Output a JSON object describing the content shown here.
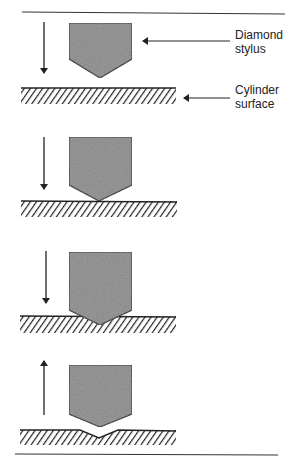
{
  "figure": {
    "labels": {
      "stylus_line1": "Diamond",
      "stylus_line2": "stylus",
      "surface_line1": "Cylinder",
      "surface_line2": "surface"
    },
    "panels": [
      {
        "step": 1,
        "motion": "down",
        "state": "stylus above surface"
      },
      {
        "step": 2,
        "motion": "down",
        "state": "stylus touching surface"
      },
      {
        "step": 3,
        "motion": "down",
        "state": "stylus penetrating surface"
      },
      {
        "step": 4,
        "motion": "up",
        "state": "stylus withdrawn, indentation remains"
      }
    ],
    "colors": {
      "stylus_fill": "#8a8a8a",
      "stroke": "#222222",
      "background": "#ffffff"
    }
  }
}
